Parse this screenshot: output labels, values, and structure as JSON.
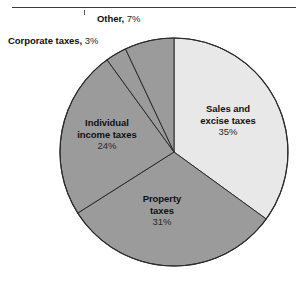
{
  "page": {
    "background_color": "#ffffff",
    "width": 305,
    "height": 284
  },
  "top_rule": {
    "present": true,
    "color": "#3a3a3a"
  },
  "chart_data": {
    "type": "pie",
    "title": "",
    "subtitle": "",
    "xlabel": "",
    "ylabel": "",
    "legend_position": "none",
    "grid": false,
    "start_angle_deg": 0,
    "direction": "clockwise",
    "categories": [
      "Sales and excise taxes",
      "Property taxes",
      "Individual income taxes",
      "Corporate taxes",
      "Other"
    ],
    "values": [
      35,
      31,
      24,
      3,
      7
    ],
    "value_labels": [
      "35%",
      "31%",
      "24%",
      "3%",
      "7%"
    ],
    "units": "percent",
    "total": 100,
    "slices": [
      {
        "name": "Sales and excise taxes",
        "name_line1": "Sales and",
        "name_line2": "excise taxes",
        "value": 35,
        "value_label": "35%",
        "color": "#e8e8e8",
        "label_placement": "inside",
        "start_deg": 0,
        "end_deg": 126
      },
      {
        "name": "Property taxes",
        "name_line1": "Property",
        "name_line2": "taxes",
        "value": 31,
        "value_label": "31%",
        "color": "#9b9b9b",
        "label_placement": "inside",
        "start_deg": 126,
        "end_deg": 237.6
      },
      {
        "name": "Individual income taxes",
        "name_line1": "Individual",
        "name_line2": "income taxes",
        "value": 24,
        "value_label": "24%",
        "color": "#9b9b9b",
        "label_placement": "inside",
        "start_deg": 237.6,
        "end_deg": 324
      },
      {
        "name": "Corporate taxes",
        "name_line1": "Corporate taxes",
        "name_line2": "",
        "value": 3,
        "value_label": "3%",
        "color": "#9b9b9b",
        "label_placement": "outside",
        "start_deg": 324,
        "end_deg": 334.8
      },
      {
        "name": "Other",
        "name_line1": "Other",
        "name_line2": "",
        "value": 7,
        "value_label": "7%",
        "color": "#9b9b9b",
        "label_placement": "outside",
        "start_deg": 334.8,
        "end_deg": 360
      }
    ],
    "geometry": {
      "center_x": 174,
      "center_y": 152,
      "radius": 114
    },
    "style": {
      "slice_outline_color": "#2b2b2b",
      "light_slice_color": "#e8e8e8",
      "dark_slice_color": "#9b9b9b"
    }
  },
  "labels": {
    "other": {
      "name": "Other,",
      "pct": "7%"
    },
    "corporate": {
      "name": "Corporate taxes,",
      "pct": "3%"
    },
    "sales": {
      "line1": "Sales and",
      "line2": "excise taxes",
      "pct": "35%"
    },
    "individual": {
      "line1": "Individual",
      "line2": "income taxes",
      "pct": "24%"
    },
    "property": {
      "line1": "Property",
      "line2": "taxes",
      "pct": "31%"
    }
  }
}
